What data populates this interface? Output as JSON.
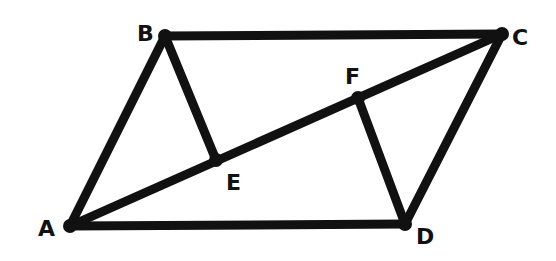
{
  "figure": {
    "type": "parallelogram-with-diagonal",
    "stroke_color": "#111111",
    "background": "#ffffff",
    "points": [
      {
        "id": "A",
        "label": "A",
        "x": 70,
        "y": 226,
        "lx": 38,
        "ly": 236
      },
      {
        "id": "B",
        "label": "B",
        "x": 165,
        "y": 36,
        "lx": 137,
        "ly": 41
      },
      {
        "id": "C",
        "label": "C",
        "x": 502,
        "y": 34,
        "lx": 512,
        "ly": 45
      },
      {
        "id": "D",
        "label": "D",
        "x": 405,
        "y": 224,
        "lx": 416,
        "ly": 244
      },
      {
        "id": "E",
        "label": "E",
        "x": 216,
        "y": 160,
        "lx": 226,
        "ly": 190
      },
      {
        "id": "F",
        "label": "F",
        "x": 358,
        "y": 98,
        "lx": 345,
        "ly": 84
      }
    ],
    "segments": [
      [
        "A",
        "B"
      ],
      [
        "B",
        "C"
      ],
      [
        "C",
        "D"
      ],
      [
        "D",
        "A"
      ],
      [
        "A",
        "C"
      ],
      [
        "B",
        "E"
      ],
      [
        "D",
        "F"
      ]
    ]
  }
}
